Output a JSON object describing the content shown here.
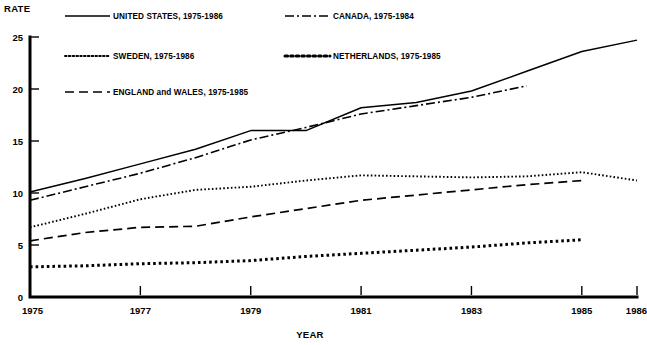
{
  "chart_data": {
    "type": "line",
    "title": "",
    "xlabel": "YEAR",
    "ylabel": "RATE",
    "xlim": [
      1975,
      1986
    ],
    "ylim": [
      0,
      25
    ],
    "grid": false,
    "legend_position": "top-inside",
    "xticks": [
      "1975",
      "1977",
      "1979",
      "1981",
      "1983",
      "1985",
      "1986"
    ],
    "xtick_values": [
      1975,
      1977,
      1979,
      1981,
      1983,
      1985,
      1986
    ],
    "yticks": [
      "0",
      "5",
      "10",
      "15",
      "20",
      "25"
    ],
    "ytick_values": [
      0,
      5,
      10,
      15,
      20,
      25
    ],
    "series": [
      {
        "name": "UNITED STATES, 1975-1986",
        "legend_label": "UNITED STATES, 1975-1986",
        "style": "solid",
        "color": "#000000",
        "x": [
          1975,
          1976,
          1977,
          1978,
          1979,
          1980,
          1981,
          1982,
          1983,
          1984,
          1985,
          1986
        ],
        "values": [
          10.1,
          11.4,
          12.8,
          14.2,
          16.0,
          16.0,
          18.2,
          18.7,
          19.8,
          21.7,
          23.6,
          24.7
        ]
      },
      {
        "name": "CANADA, 1975-1984",
        "legend_label": "CANADA, 1975-1984",
        "style": "dash-dot",
        "color": "#000000",
        "x": [
          1975,
          1976,
          1977,
          1978,
          1979,
          1980,
          1981,
          1982,
          1983,
          1984
        ],
        "values": [
          9.3,
          10.6,
          11.9,
          13.4,
          15.1,
          16.3,
          17.6,
          18.4,
          19.2,
          20.3
        ]
      },
      {
        "name": "SWEDEN, 1975-1986",
        "legend_label": "SWEDEN, 1975-1986",
        "style": "dotted-fine",
        "color": "#000000",
        "x": [
          1975,
          1976,
          1977,
          1978,
          1979,
          1980,
          1981,
          1982,
          1983,
          1984,
          1985,
          1986
        ],
        "values": [
          6.7,
          8.0,
          9.4,
          10.3,
          10.6,
          11.2,
          11.7,
          11.6,
          11.5,
          11.6,
          12.0,
          11.2
        ]
      },
      {
        "name": "ENGLAND and WALES, 1975-1985",
        "legend_label": "ENGLAND and WALES, 1975-1985",
        "style": "dashed",
        "color": "#000000",
        "x": [
          1975,
          1976,
          1977,
          1978,
          1979,
          1980,
          1981,
          1982,
          1983,
          1984,
          1985
        ],
        "values": [
          5.4,
          6.2,
          6.7,
          6.8,
          7.7,
          8.5,
          9.3,
          9.8,
          10.3,
          10.8,
          11.2
        ]
      },
      {
        "name": "NETHERLANDS, 1975-1985",
        "legend_label": "NETHERLANDS, 1975-1985",
        "style": "dotted-bold",
        "color": "#000000",
        "x": [
          1975,
          1976,
          1977,
          1978,
          1979,
          1980,
          1981,
          1982,
          1983,
          1984,
          1985
        ],
        "values": [
          2.9,
          3.0,
          3.2,
          3.3,
          3.5,
          3.9,
          4.2,
          4.5,
          4.8,
          5.2,
          5.5
        ]
      }
    ]
  },
  "axis": {
    "y_title": "RATE",
    "x_title": "YEAR"
  },
  "legend": {
    "entries": [
      {
        "label": "UNITED STATES, 1975-1986",
        "style": "solid"
      },
      {
        "label": "CANADA, 1975-1984",
        "style": "dash-dot"
      },
      {
        "label": "SWEDEN, 1975-1986",
        "style": "dotted-fine"
      },
      {
        "label": "NETHERLANDS, 1975-1985",
        "style": "dotted-bold"
      },
      {
        "label": "ENGLAND and WALES, 1975-1985",
        "style": "dashed"
      }
    ]
  }
}
